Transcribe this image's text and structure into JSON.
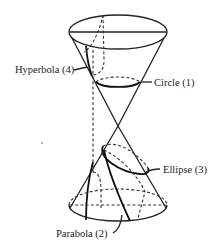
{
  "figure": {
    "labels": {
      "hyperbola": "Hyperbola (4)",
      "circle": "Circle (1)",
      "ellipse": "Ellipse (3)",
      "parabola": "Parabola (2)"
    },
    "stroke_color": "#222222",
    "background": "#ffffff"
  }
}
